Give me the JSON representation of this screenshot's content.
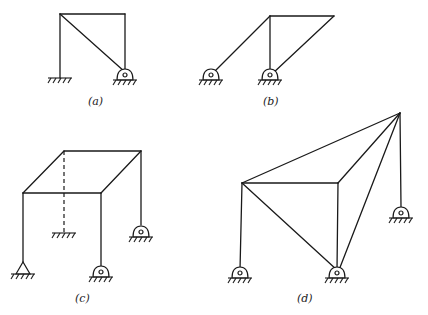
{
  "figure": {
    "panels": [
      {
        "id": "a",
        "label": "(a)",
        "description": "Portal frame with diagonal brace; left fixed support, right pin support"
      },
      {
        "id": "b",
        "label": "(b)",
        "description": "Frame with inclined member to left pin and diagonal from top-right to center pin"
      },
      {
        "id": "c",
        "label": "(c)",
        "description": "Three-dimensional box frame with dashed hidden column to fixed base, pin supports"
      },
      {
        "id": "d",
        "label": "(d)",
        "description": "Three-dimensional frame with apex node connected to multiple members and pin supports"
      }
    ]
  },
  "colors": {
    "line": "#1a1a1a",
    "background": "#ffffff"
  }
}
